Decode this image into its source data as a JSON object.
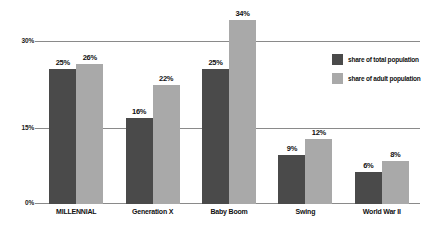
{
  "chart_data": {
    "type": "bar",
    "title": "",
    "xlabel": "",
    "ylabel": "",
    "ylim": [
      0,
      30
    ],
    "yticks": [
      "0%",
      "15%",
      "30%"
    ],
    "grid": true,
    "legend_position": "right",
    "categories": [
      "MILLENNIAL",
      "Generation X",
      "Baby Boom",
      "Swing",
      "World War II"
    ],
    "series": [
      {
        "name": "share of total population",
        "color": "#4a4a4a",
        "values": [
          25,
          16,
          25,
          9,
          6
        ],
        "labels": [
          "25%",
          "16%",
          "25%",
          "9%",
          "6%"
        ]
      },
      {
        "name": "share of adult population",
        "color": "#a9a9a9",
        "values": [
          26,
          22,
          34,
          12,
          8
        ],
        "labels": [
          "26%",
          "22%",
          "34%",
          "12%",
          "8%"
        ]
      }
    ]
  },
  "axis": {
    "y_tick_30": "30%",
    "y_tick_15": "15%",
    "y_tick_0": "0%"
  },
  "legend": {
    "items": [
      {
        "label": "share of total population",
        "color": "#4a4a4a"
      },
      {
        "label": "share of adult population",
        "color": "#a9a9a9"
      }
    ]
  },
  "colors": {
    "total_population": "#4a4a4a",
    "adult_population": "#a9a9a9",
    "gridline": "#8a8a8a",
    "text": "#111111",
    "background": "#ffffff"
  }
}
